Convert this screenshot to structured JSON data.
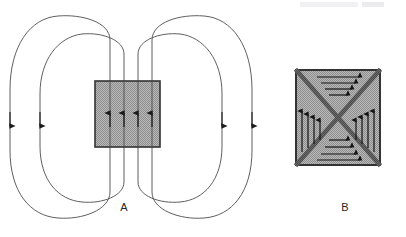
{
  "figure": {
    "background_color": "#ffffff",
    "line_color": "#3c3c3c",
    "arrow_color": "#1a1a1a",
    "hatch_fill_color": "#a8a8a8",
    "hatch_dot_color": "#d8d8d8",
    "border_color": "#333333",
    "diagonal_color": "#4a4a4a",
    "label_color": "#262626",
    "watermark_color": "#d9d9dd"
  },
  "watermark": {
    "text": "",
    "visible": false
  },
  "panels": [
    {
      "id": "panel-a",
      "label": "A",
      "label_x": 124,
      "label_y": 211,
      "description": "bar magnet with external dipole field loops",
      "magnet": {
        "x": 95,
        "y": 81,
        "width": 65,
        "height": 66,
        "fill": "#a8a8a8",
        "stroke": "#333333"
      },
      "internal_field_lines": [
        {
          "x": 110,
          "direction": "up"
        },
        {
          "x": 124,
          "direction": "up"
        },
        {
          "x": 138,
          "direction": "up"
        },
        {
          "x": 152,
          "direction": "up"
        }
      ],
      "loops": [
        {
          "name": "outer-left",
          "inner_x": 110,
          "outer_x": 10,
          "top_y": 18,
          "bottom_y": 210,
          "arrow_y": 122,
          "arrow_direction": "down"
        },
        {
          "name": "inner-left",
          "inner_x": 124,
          "outer_x": 38,
          "top_y": 36,
          "bottom_y": 196,
          "arrow_y": 122,
          "arrow_direction": "down"
        },
        {
          "name": "inner-right",
          "inner_x": 138,
          "outer_x": 224,
          "top_y": 36,
          "bottom_y": 196,
          "arrow_y": 122,
          "arrow_direction": "down"
        },
        {
          "name": "outer-right",
          "inner_x": 152,
          "outer_x": 252,
          "top_y": 18,
          "bottom_y": 210,
          "arrow_y": 122,
          "arrow_direction": "down"
        }
      ]
    },
    {
      "id": "panel-b",
      "label": "B",
      "label_x": 345,
      "label_y": 211,
      "description": "square domain with X diagonals and four inward-pointing closure domains",
      "square": {
        "x": 296,
        "y": 70,
        "width": 84,
        "height": 95,
        "fill": "#a8a8a8",
        "stroke": "#333333"
      },
      "diagonals": [
        {
          "from": "top-left",
          "to": "bottom-right"
        },
        {
          "from": "top-right",
          "to": "bottom-left"
        }
      ],
      "domain_arrows": {
        "top": {
          "direction": "right",
          "count": 4,
          "note": "horizontal arrows pointing right toward center"
        },
        "bottom": {
          "direction": "right",
          "count": 3,
          "note": "horizontal arrows pointing right toward center"
        },
        "left": {
          "direction": "up",
          "count": 4,
          "note": "vertical arrows pointing up toward center"
        },
        "right": {
          "direction": "up",
          "count": 4,
          "note": "vertical arrows pointing up toward center"
        }
      }
    }
  ]
}
